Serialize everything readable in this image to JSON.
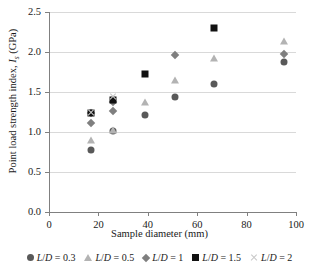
{
  "chart_data": {
    "type": "scatter",
    "title": "",
    "xlabel": "Sample diameter (mm)",
    "ylabel": "Point load strength index, Is (GPa)",
    "ylabel_main": "Point load strength index, ",
    "ylabel_symbol": "I",
    "ylabel_subscript": "s",
    "ylabel_unit": " (GPa)",
    "xlim": [
      0,
      100
    ],
    "ylim": [
      0.0,
      2.5
    ],
    "xticks": [
      0,
      20,
      40,
      60,
      80,
      100
    ],
    "xtick_labels": [
      "0",
      "20",
      "40",
      "60",
      "80",
      "100"
    ],
    "yticks": [
      0.0,
      0.5,
      1.0,
      1.5,
      2.0,
      2.5
    ],
    "ytick_labels": [
      "0.0",
      "0.5",
      "1.0",
      "1.5",
      "2.0",
      "2.5"
    ],
    "grid": "horizontal",
    "legend_position": "bottom",
    "series": [
      {
        "name": "L/D = 0.3",
        "legend_prefix": "L",
        "legend_slash": "/",
        "legend_mid": "D",
        "legend_value": " = 0.3",
        "marker": "circle",
        "color": "#595959",
        "points": [
          {
            "x": 17,
            "y": 0.77
          },
          {
            "x": 26,
            "y": 1.01
          },
          {
            "x": 39,
            "y": 1.21
          },
          {
            "x": 51,
            "y": 1.44
          },
          {
            "x": 67,
            "y": 1.6
          },
          {
            "x": 95,
            "y": 1.87
          }
        ]
      },
      {
        "name": "L/D = 0.5",
        "legend_prefix": "L",
        "legend_slash": "/",
        "legend_mid": "D",
        "legend_value": " = 0.5",
        "marker": "triangle",
        "color": "#b3b3b3",
        "points": [
          {
            "x": 17,
            "y": 0.9
          },
          {
            "x": 26,
            "y": 1.02
          },
          {
            "x": 39,
            "y": 1.38
          },
          {
            "x": 51,
            "y": 1.65
          },
          {
            "x": 67,
            "y": 1.92
          },
          {
            "x": 95,
            "y": 2.14
          }
        ]
      },
      {
        "name": "L/D = 1",
        "legend_prefix": "L",
        "legend_slash": "/",
        "legend_mid": "D",
        "legend_value": " = 1",
        "marker": "diamond",
        "color": "#7f7f7f",
        "points": [
          {
            "x": 17,
            "y": 1.11
          },
          {
            "x": 17,
            "y": 1.24
          },
          {
            "x": 26,
            "y": 1.26
          },
          {
            "x": 26,
            "y": 1.37
          },
          {
            "x": 51,
            "y": 1.96
          },
          {
            "x": 95,
            "y": 1.98
          }
        ]
      },
      {
        "name": "L/D = 1.5",
        "legend_prefix": "L",
        "legend_slash": "/",
        "legend_mid": "D",
        "legend_value": " = 1.5",
        "marker": "square",
        "color": "#111111",
        "points": [
          {
            "x": 17,
            "y": 1.24
          },
          {
            "x": 26,
            "y": 1.4
          },
          {
            "x": 39,
            "y": 1.73
          },
          {
            "x": 67,
            "y": 2.3
          }
        ]
      },
      {
        "name": "L/D = 2",
        "legend_prefix": "L",
        "legend_slash": "/",
        "legend_mid": "D",
        "legend_value": " = 2",
        "marker": "x",
        "color": "#c8c8c8",
        "points": [
          {
            "x": 17,
            "y": 1.25
          },
          {
            "x": 26,
            "y": 1.44
          }
        ]
      }
    ]
  }
}
